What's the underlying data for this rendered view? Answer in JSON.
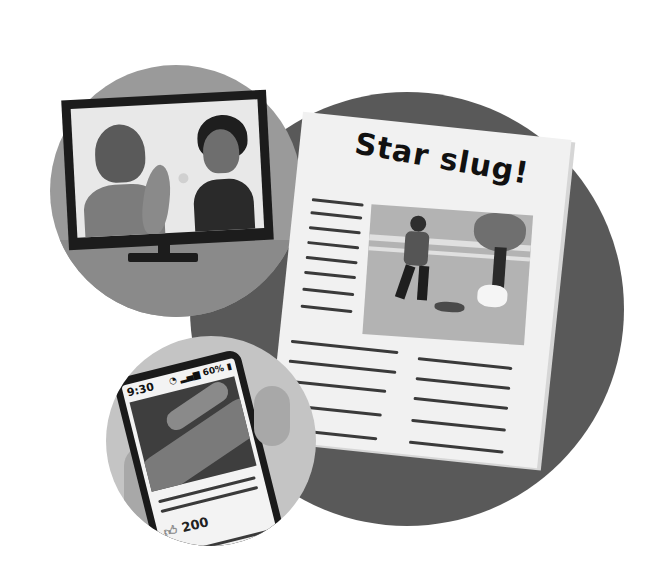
{
  "scene": {
    "description": "Illustration of a slug becoming famous: TV interview, newspaper headline, and a phone social post",
    "palette": {
      "background": "#ffffff",
      "big_circle": "#595959",
      "tv_circle": "#9a9a9a",
      "phone_circle": "#c4c4c4",
      "paper": "#f1f1f1",
      "ink": "#111111"
    }
  },
  "tv": {
    "icon": "television-icon",
    "content": "Boy holding a slug being interviewed by a reporter with a microphone"
  },
  "newspaper": {
    "headline": "Star slug!",
    "photo": "Boy walking a slug on a leash next to a dog on a leash by a fence and tree"
  },
  "phone": {
    "status_time": "9:30",
    "status_icons": [
      "wifi-icon",
      "signal-icon"
    ],
    "battery_text": "60%",
    "photo": "Close-up of a slug",
    "likes_icon": "thumbs-up-icon",
    "likes_count": "200"
  }
}
